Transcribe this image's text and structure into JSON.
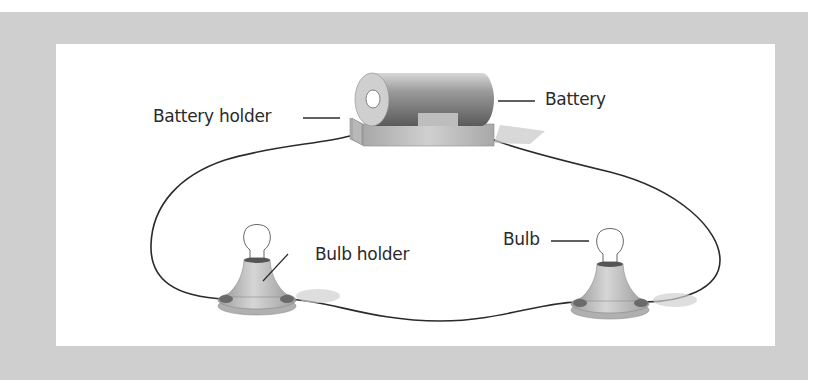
{
  "diagram": {
    "type": "simple electric circuit",
    "labels": {
      "battery_holder": "Battery holder",
      "battery": "Battery",
      "bulb_holder": "Bulb holder",
      "bulb": "Bulb"
    },
    "components": [
      {
        "id": "battery",
        "icon": "battery-icon"
      },
      {
        "id": "battery_holder",
        "icon": "battery-holder-icon"
      },
      {
        "id": "bulb_left",
        "icon": "bulb-icon"
      },
      {
        "id": "bulb_holder_left",
        "icon": "bulb-holder-icon"
      },
      {
        "id": "bulb_right",
        "icon": "bulb-icon"
      },
      {
        "id": "bulb_holder_right",
        "icon": "bulb-holder-icon"
      }
    ],
    "connections": [
      [
        "battery",
        "bulb_holder_left"
      ],
      [
        "bulb_holder_left",
        "bulb_holder_right"
      ],
      [
        "bulb_holder_right",
        "battery"
      ]
    ],
    "colors": {
      "frame": "#cfcfcf",
      "panel": "#ffffff",
      "wire": "#2b2b2b",
      "battery_dark": "#7a7a7a",
      "holder": "#bdbdbd",
      "text": "#2a2a2a"
    }
  }
}
